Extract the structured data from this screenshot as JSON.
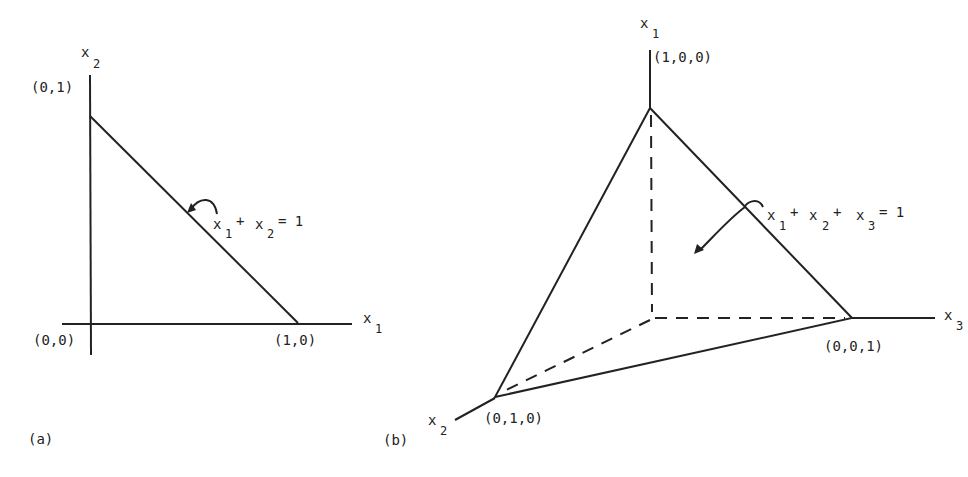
{
  "panel_a": {
    "caption": "(a)",
    "axis_x_label": "x",
    "axis_x_sub": "1",
    "axis_y_label": "x",
    "axis_y_sub": "2",
    "point_origin": "(0,0)",
    "point_y": "(0,1)",
    "point_x": "(1,0)",
    "equation": {
      "t1": "x",
      "s1": "1",
      "plus": "+",
      "t2": "x",
      "s2": "2",
      "eq": "= 1"
    }
  },
  "panel_b": {
    "caption": "(b)",
    "axis_1_label": "x",
    "axis_1_sub": "1",
    "axis_2_label": "x",
    "axis_2_sub": "2",
    "axis_3_label": "x",
    "axis_3_sub": "3",
    "point_1": "(1,0,0)",
    "point_2": "(0,1,0)",
    "point_3": "(0,0,1)",
    "equation": {
      "t1": "x",
      "s1": "1",
      "plus1": "+",
      "t2": "x",
      "s2": "2",
      "plus2": "+",
      "t3": "x",
      "s3": "3",
      "eq": "= 1"
    }
  }
}
